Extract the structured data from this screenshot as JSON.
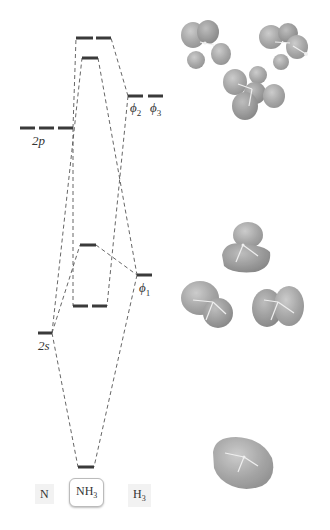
{
  "diagram": {
    "colors": {
      "level": "#3a3a3a",
      "connector": "#555555",
      "orbital_lobe": "#9a9a9a",
      "orbital_highlight": "#c4c4c4",
      "background": "#ffffff"
    },
    "columns": [
      {
        "id": "N",
        "label": "N",
        "subscript": ""
      },
      {
        "id": "NH3",
        "label": "NH",
        "subscript": "3"
      },
      {
        "id": "H3",
        "label": "H",
        "subscript": "3"
      }
    ],
    "atomic_levels": {
      "N_2p": {
        "label": "2p",
        "count": 3
      },
      "N_2s": {
        "label": "2s",
        "count": 1
      },
      "H3_phi1": {
        "label": "ϕ",
        "subscript": "1",
        "count": 1
      },
      "H3_phi2": {
        "label": "ϕ",
        "subscript": "2"
      },
      "H3_phi3": {
        "label": "ϕ",
        "subscript": "3"
      }
    },
    "molecular_levels": [
      {
        "id": "e_antibonding",
        "count": 2
      },
      {
        "id": "a1_antibonding",
        "count": 1
      },
      {
        "id": "a1_nonbonding",
        "count": 1
      },
      {
        "id": "e_bonding",
        "count": 2
      },
      {
        "id": "a1_bonding",
        "count": 1
      }
    ],
    "orbital_images": [
      {
        "id": "e_antibonding_a",
        "description": "antibonding orbital, multi-lobe"
      },
      {
        "id": "e_antibonding_b",
        "description": "antibonding orbital, multi-lobe"
      },
      {
        "id": "a1_antibonding",
        "description": "antibonding orbital, multi-lobe"
      },
      {
        "id": "a1_nonbonding",
        "description": "lone pair orbital"
      },
      {
        "id": "e_bonding_a",
        "description": "bonding orbital, two lobes"
      },
      {
        "id": "e_bonding_b",
        "description": "bonding orbital, two lobes"
      },
      {
        "id": "a1_bonding",
        "description": "fully bonding orbital, single envelope"
      }
    ]
  }
}
